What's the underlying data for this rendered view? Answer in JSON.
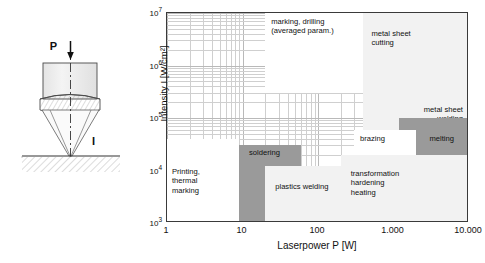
{
  "schematic": {
    "name": "laser-focusing-optics",
    "power_label": "P",
    "intensity_label": "I",
    "arrow_icon": "down-arrow-icon"
  },
  "chart_data": {
    "type": "heatmap",
    "title": "",
    "xlabel": "Laserpower P [W]",
    "ylabel": "Intensity I [W/cm²]",
    "xlim": [
      1,
      10000
    ],
    "ylim": [
      1000,
      10000000
    ],
    "xscale": "log",
    "yscale": "log",
    "grid": true,
    "legend": "none",
    "xticks": [
      {
        "value": 1,
        "label": "1"
      },
      {
        "value": 10,
        "label": "10"
      },
      {
        "value": 100,
        "label": "100"
      },
      {
        "value": 1000,
        "label": "1.000"
      },
      {
        "value": 10000,
        "label": "10.000"
      }
    ],
    "yticks": [
      {
        "value": 1000,
        "mantissa": "10",
        "exponent": "3"
      },
      {
        "value": 10000,
        "mantissa": "10",
        "exponent": "4"
      },
      {
        "value": 100000,
        "mantissa": "10",
        "exponent": "5"
      },
      {
        "value": 1000000,
        "mantissa": "10",
        "exponent": "6"
      },
      {
        "value": 10000000,
        "mantissa": "10",
        "exponent": "7"
      }
    ],
    "regions": [
      {
        "name": "marking-drilling",
        "label": "marking, drilling\n(averaged param.)",
        "shade": "white",
        "x_range": [
          20,
          1000
        ],
        "y_range": [
          300000,
          10000000
        ]
      },
      {
        "name": "metal-sheet-cutting",
        "label": "metal sheet\ncutting",
        "shade": "light",
        "x_range": [
          400,
          10000
        ],
        "y_range": [
          200000,
          10000000
        ]
      },
      {
        "name": "metal-sheet-welding",
        "label": "metal sheet\nwelding",
        "shade": "light",
        "x_range": [
          400,
          10000
        ],
        "y_range": [
          60000,
          1000000
        ]
      },
      {
        "name": "melting",
        "label": "melting",
        "shade": "dark",
        "x_range": [
          1200,
          10000
        ],
        "y_range": [
          20000,
          100000
        ]
      },
      {
        "name": "brazing",
        "label": "brazing",
        "shade": "white",
        "x_range": [
          300,
          2000
        ],
        "y_range": [
          20000,
          60000
        ]
      },
      {
        "name": "soldering",
        "label": "soldering",
        "shade": "dark",
        "x_range": [
          9,
          60
        ],
        "y_range": [
          1000,
          30000
        ]
      },
      {
        "name": "plastics-welding",
        "label": "plastics welding",
        "shade": "light",
        "x_range": [
          20,
          200
        ],
        "y_range": [
          1000,
          12000
        ]
      },
      {
        "name": "printing-thermal-marking",
        "label": "Printing,\nthermal\nmarking",
        "shade": "white",
        "x_range": [
          1,
          9
        ],
        "y_range": [
          1000,
          40000
        ]
      },
      {
        "name": "transformation-hardening-heating",
        "label": "transformation\nhardening\nheating",
        "shade": "light",
        "x_range": [
          200,
          10000
        ],
        "y_range": [
          1000,
          20000
        ]
      }
    ]
  }
}
